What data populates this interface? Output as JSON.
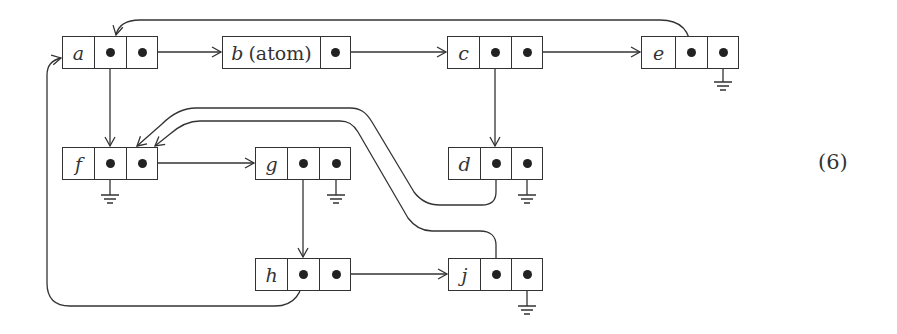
{
  "equation_number": "(6)",
  "nodes": {
    "a": {
      "label": "a",
      "x": 62,
      "y": 36,
      "cells": [
        "label",
        "pointer",
        "pointer"
      ]
    },
    "b": {
      "label": "b",
      "suffix": "(atom)",
      "x": 222,
      "y": 36,
      "cells": [
        "label-wide",
        "pointer"
      ]
    },
    "c": {
      "label": "c",
      "x": 447,
      "y": 36,
      "cells": [
        "label",
        "pointer",
        "pointer"
      ]
    },
    "e": {
      "label": "e",
      "x": 641,
      "y": 36,
      "cells": [
        "label",
        "pointer",
        "pointer-nil"
      ]
    },
    "f": {
      "label": "f",
      "x": 62,
      "y": 147,
      "cells": [
        "label",
        "pointer-nil",
        "pointer"
      ]
    },
    "g": {
      "label": "g",
      "x": 255,
      "y": 147,
      "cells": [
        "label",
        "pointer",
        "pointer-nil"
      ]
    },
    "d": {
      "label": "d",
      "x": 448,
      "y": 147,
      "cells": [
        "label",
        "pointer",
        "pointer-nil"
      ]
    },
    "h": {
      "label": "h",
      "x": 255,
      "y": 258,
      "cells": [
        "label",
        "pointer",
        "pointer"
      ]
    },
    "j": {
      "label": "j",
      "x": 448,
      "y": 258,
      "cells": [
        "label",
        "pointer",
        "pointer-nil"
      ]
    }
  },
  "edges": [
    {
      "from": "a.car",
      "to": "f"
    },
    {
      "from": "a.cdr",
      "to": "b"
    },
    {
      "from": "b.cdr",
      "to": "c"
    },
    {
      "from": "c.car",
      "to": "d"
    },
    {
      "from": "c.cdr",
      "to": "e"
    },
    {
      "from": "e.car",
      "to": "a"
    },
    {
      "from": "e.cdr",
      "to": "nil"
    },
    {
      "from": "f.car",
      "to": "nil"
    },
    {
      "from": "f.cdr",
      "to": "g"
    },
    {
      "from": "g.car",
      "to": "h"
    },
    {
      "from": "g.cdr",
      "to": "nil"
    },
    {
      "from": "d.car",
      "to": "f"
    },
    {
      "from": "d.cdr",
      "to": "nil"
    },
    {
      "from": "h.car",
      "to": "a"
    },
    {
      "from": "h.cdr",
      "to": "j"
    },
    {
      "from": "j.car",
      "to": "f"
    },
    {
      "from": "j.cdr",
      "to": "nil"
    }
  ],
  "colors": {
    "stroke": "#333333",
    "background": "#ffffff"
  }
}
